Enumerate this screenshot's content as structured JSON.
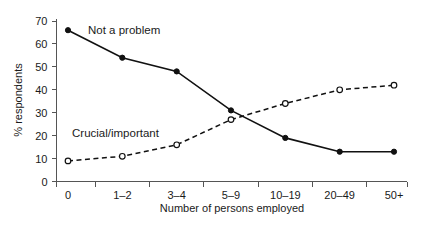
{
  "chart_data": {
    "type": "line",
    "title": "",
    "xlabel": "Number of persons employed",
    "ylabel": "% respondents",
    "categories": [
      "0",
      "1–2",
      "3–4",
      "5–9",
      "10–19",
      "20–49",
      "50+"
    ],
    "ylim": [
      0,
      70
    ],
    "yticks": [
      0,
      10,
      20,
      30,
      40,
      50,
      60,
      70
    ],
    "ytick_labels": [
      "0",
      "10",
      "20",
      "30",
      "40",
      "50",
      "60",
      "70"
    ],
    "grid": false,
    "legend": "inline-annotations",
    "series": [
      {
        "name": "Not a problem",
        "values": [
          66,
          54,
          48,
          31,
          19,
          13,
          13
        ],
        "style": "solid",
        "marker": "filled-circle",
        "label_x": 7.5,
        "label_y": 64.5
      },
      {
        "name": "Crucial/important",
        "values": [
          9,
          11,
          16,
          27,
          34,
          40,
          42
        ],
        "style": "dashed",
        "marker": "open-circle",
        "label_x": 0.55,
        "label_y": 19.5
      }
    ]
  },
  "axes": {
    "y_axis_title": "% respondents",
    "x_axis_title": "Number of persons employed"
  },
  "annotations": {
    "series_one_label": "Not a problem",
    "series_two_label": "Crucial/important"
  }
}
